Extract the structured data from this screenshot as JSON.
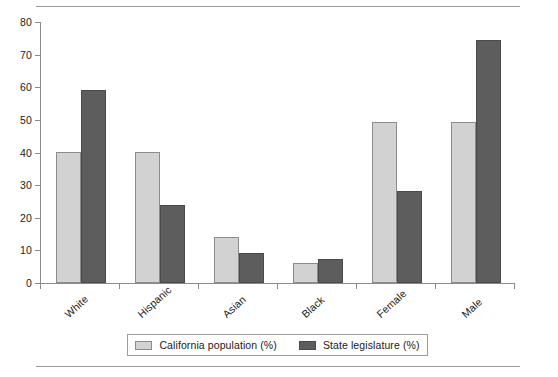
{
  "chart_data": {
    "type": "bar",
    "title": "",
    "subtitle": "",
    "xlabel": "",
    "ylabel": "",
    "categories": [
      "White",
      "Hispanic",
      "Asian",
      "Black",
      "Female",
      "Male"
    ],
    "series": [
      {
        "name": "California population (%)",
        "color": "#d2d2d2",
        "values": [
          40,
          40.3,
          14,
          6,
          49.2,
          49.5
        ]
      },
      {
        "name": "State legislature (%)",
        "color": "#5d5d5d",
        "values": [
          59.3,
          23.8,
          9.2,
          7.5,
          28.1,
          74.4
        ]
      }
    ],
    "ylim": [
      0,
      80
    ],
    "ytick_values": [
      0,
      10,
      20,
      30,
      40,
      50,
      60,
      70,
      80
    ],
    "ytick_labels": [
      "0",
      "10",
      "20",
      "30",
      "40",
      "50",
      "60",
      "70",
      "80"
    ],
    "grid": false,
    "legend_position": "bottom",
    "xtick_label_rotation": -42,
    "annotations": []
  },
  "legend": {
    "items": [
      {
        "label": "California population (%)",
        "swatch": "light-gray-swatch"
      },
      {
        "label": "State legislature (%)",
        "swatch": "dark-gray-swatch"
      }
    ]
  },
  "rules": {
    "top": "horizontal-rule",
    "bottom": "horizontal-rule"
  },
  "colors": {
    "series_light": "#d2d2d2",
    "series_dark": "#5d5d5d",
    "axis": "#8a8a8a",
    "text": "#1a1a1a",
    "rule": "#9b9b9b"
  }
}
